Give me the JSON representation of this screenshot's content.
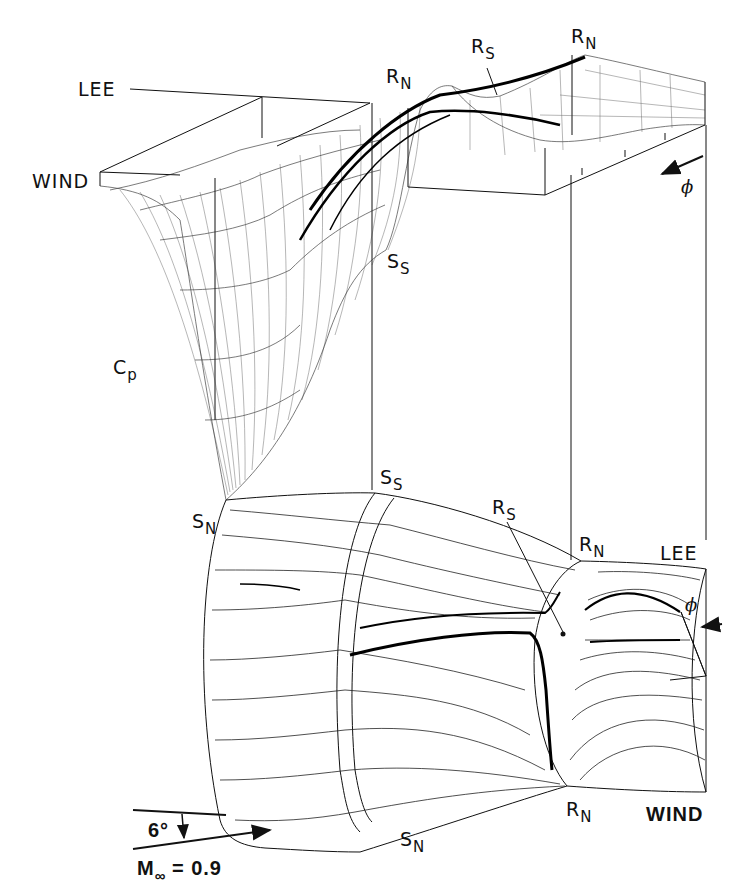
{
  "figure": {
    "type": "3D surface pressure (Cp) carpet plot above body with oil-flow surface streamline pattern",
    "colors": {
      "ink": "#111111",
      "background": "#ffffff"
    }
  },
  "labels": {
    "cp_plot": {
      "lee": "LEE",
      "wind": "WIND",
      "phi": "ϕ",
      "axis_cp_main": "C",
      "axis_cp_sub": "p",
      "rn_left_main": "R",
      "rn_left_sub": "N",
      "rs_main": "R",
      "rs_sub": "S",
      "rn_right_main": "R",
      "rn_right_sub": "N",
      "ss_main": "S",
      "ss_sub": "S",
      "sn_main": "S",
      "sn_sub": "N"
    },
    "body": {
      "ss_main": "S",
      "ss_sub": "S",
      "rs_main": "R",
      "rs_sub": "S",
      "rn_top_main": "R",
      "rn_top_sub": "N",
      "lee": "LEE",
      "phi": "ϕ",
      "rn_bottom_main": "R",
      "rn_bottom_sub": "N",
      "wind": "WIND",
      "sn_main": "S",
      "sn_sub": "N"
    },
    "flow_conditions": {
      "angle": "6°",
      "mach_main": "M",
      "mach_sub": "∞",
      "mach_value": " = 0.9"
    }
  }
}
